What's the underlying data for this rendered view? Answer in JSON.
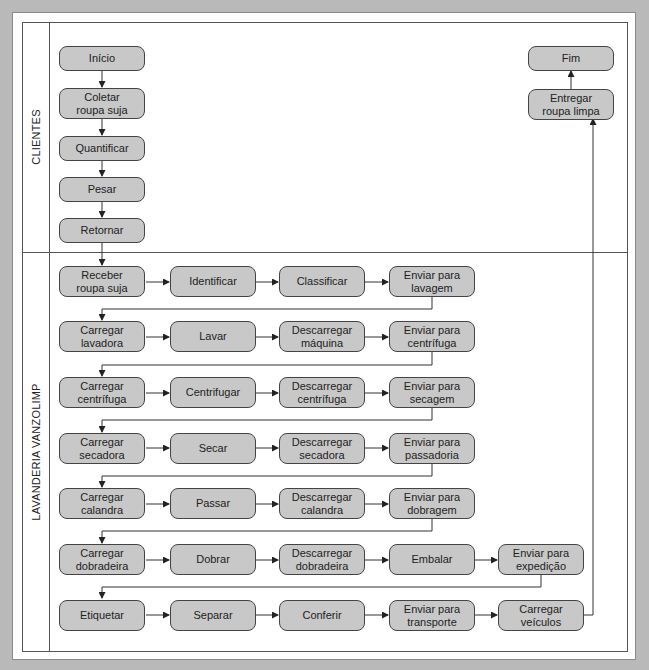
{
  "lanes": {
    "clientes": {
      "label": "CLIENTES"
    },
    "lavanderia": {
      "label": "LAVANDERIA VANZOLIMP"
    }
  },
  "clientes_steps": {
    "inicio": "Início",
    "coletar": "Coletar\nroupa suja",
    "quantificar": "Quantificar",
    "pesar": "Pesar",
    "retornar": "Retornar",
    "entregar": "Entregar\nroupa limpa",
    "fim": "Fim"
  },
  "lavanderia_rows": [
    [
      "Receber\nroupa suja",
      "Identificar",
      "Classificar",
      "Enviar para\nlavagem"
    ],
    [
      "Carregar\nlavadora",
      "Lavar",
      "Descarregar\nmáquina",
      "Enviar para\ncentrífuga"
    ],
    [
      "Carregar\ncentrífuga",
      "Centrifugar",
      "Descarregar\ncentrífuga",
      "Enviar para\nsecagem"
    ],
    [
      "Carregar\nsecadora",
      "Secar",
      "Descarregar\nsecadora",
      "Enviar para\npassadoria"
    ],
    [
      "Carregar\ncalandra",
      "Passar",
      "Descarregar\ncalandra",
      "Enviar para\ndobragem"
    ],
    [
      "Carregar\ndobradeira",
      "Dobrar",
      "Descarregar\ndobradeira",
      "Embalar",
      "Enviar para\nexpedição"
    ],
    [
      "Etiquetar",
      "Separar",
      "Conferir",
      "Enviar para\ntransporte",
      "Carregar\nveículos"
    ]
  ],
  "colors": {
    "background": "#b9b9b9",
    "box_fill": "#c8c8c8",
    "box_border": "#444444",
    "line": "#333333"
  }
}
